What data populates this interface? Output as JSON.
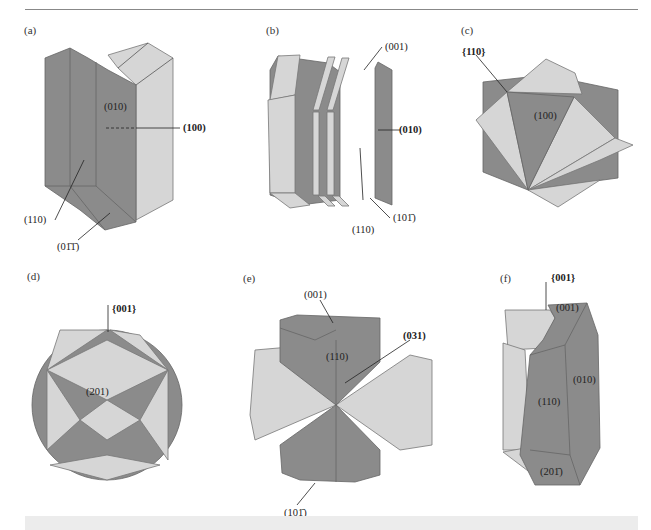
{
  "page": {
    "header_running_text": "",
    "colors": {
      "dark_face": "#8b8b8b",
      "light_face": "#d6d6d6",
      "edge": "#666666",
      "caption_band": "#ececec"
    }
  },
  "panels": [
    {
      "id": "a",
      "label": "(a)",
      "faces": [
        "(010)",
        "(100)",
        "(110)",
        "(01̄1̄)"
      ]
    },
    {
      "id": "b",
      "label": "(b)",
      "faces": [
        "(001)",
        "(010)",
        "(110)",
        "(101̄)"
      ]
    },
    {
      "id": "c",
      "label": "(c)",
      "faces": [
        "{110}",
        "(100)"
      ]
    },
    {
      "id": "d",
      "label": "(d)",
      "faces": [
        "{001}",
        "(201)"
      ]
    },
    {
      "id": "e",
      "label": "(e)",
      "faces": [
        "(001)",
        "(110)",
        "(031)",
        "(101̄)"
      ]
    },
    {
      "id": "f",
      "label": "(f)",
      "faces": [
        "{001}",
        "(001)",
        "(010)",
        "(110)",
        "(201̄)"
      ]
    }
  ]
}
